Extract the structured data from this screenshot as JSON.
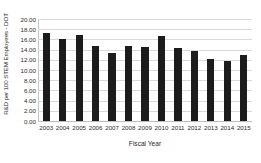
{
  "chart_data": {
    "type": "bar",
    "title": "",
    "xlabel": "Fiscal Year",
    "ylabel": "R&D per 100 STEM Employees - DOT",
    "categories": [
      "2003",
      "2004",
      "2005",
      "2006",
      "2007",
      "2008",
      "2009",
      "2010",
      "2011",
      "2012",
      "2013",
      "2014",
      "2015"
    ],
    "values": [
      17.2,
      16.0,
      16.8,
      14.7,
      13.4,
      14.8,
      14.6,
      16.7,
      14.4,
      13.8,
      12.2,
      11.8,
      13.0
    ],
    "ylim": [
      0,
      20
    ],
    "y_ticks": [
      0,
      2,
      4,
      6,
      8,
      10,
      12,
      14,
      16,
      18,
      20
    ],
    "y_tick_labels": [
      "0.00",
      "2.00",
      "4.00",
      "6.00",
      "8.00",
      "10.00",
      "12.00",
      "14.00",
      "16.00",
      "18.00",
      "20.00"
    ],
    "grid": true,
    "legend": null,
    "bar_color": "#1c1c1c",
    "gridline_color": "#d9d9d9",
    "background_color": "#ffffff"
  }
}
